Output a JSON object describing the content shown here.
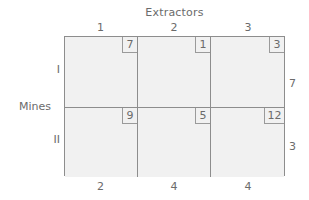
{
  "figure": {
    "column_group_title": "Extractors",
    "row_group_title": "Mines",
    "column_headers": [
      "1",
      "2",
      "3"
    ],
    "row_headers": [
      "I",
      "II"
    ],
    "supplies": [
      "7",
      "3"
    ],
    "demands": [
      "2",
      "4",
      "4"
    ],
    "costs": [
      [
        "7",
        "1",
        "3"
      ],
      [
        "9",
        "5",
        "12"
      ]
    ],
    "colors": {
      "cell_fill": "#f1f1f1",
      "grid_line": "#8d8d8d",
      "text": "#6b6b6b",
      "background": "#ffffff"
    }
  },
  "chart_data": {
    "type": "table",
    "title": "Extractors",
    "xlabel": "Extractors",
    "ylabel": "Mines",
    "categories": [
      "1",
      "2",
      "3"
    ],
    "row_categories": [
      "I",
      "II"
    ],
    "series": [
      {
        "name": "I",
        "values": [
          7,
          1,
          3
        ]
      },
      {
        "name": "II",
        "values": [
          9,
          5,
          12
        ]
      }
    ],
    "supply": [
      7,
      3
    ],
    "demand": [
      2,
      4,
      4
    ],
    "grid": true,
    "legend": "none"
  }
}
